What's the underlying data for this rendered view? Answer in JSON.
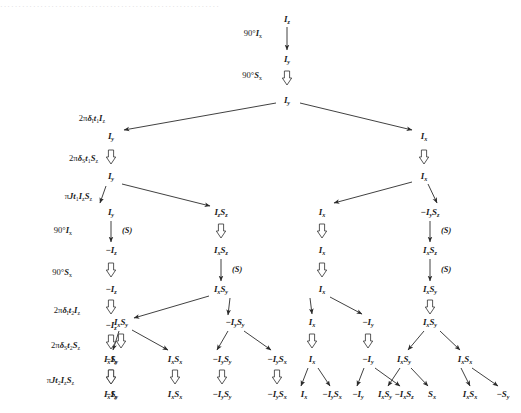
{
  "figure": {
    "title_fragment": "product operator evolution tree",
    "cropped_header_text": "····························································",
    "colors": {
      "text": "#1a1a1a",
      "arrow": "#2b2b2b",
      "double_arrow": "#3a3a3a",
      "background": "#ffffff"
    }
  },
  "operator_labels": [
    {
      "id": "op-90-ix-1",
      "html": "90°<i>I</i><sub>x</sub>",
      "x": 262,
      "y": 33
    },
    {
      "id": "op-90-sx-1",
      "html": "90°<i>S</i><sub>x</sub>",
      "x": 262,
      "y": 75
    },
    {
      "id": "op-2pi-di-t1",
      "html": "2π<i>δ</i><sub>I</sub><i>t</i><sub>1</sub><i>I</i><sub>z</sub>",
      "x": 105,
      "y": 118
    },
    {
      "id": "op-2pi-ds-t1",
      "html": "2π<i>δ</i><sub>S</sub><i>t</i><sub>1</sub><i>S</i><sub>z</sub>",
      "x": 98,
      "y": 158
    },
    {
      "id": "op-pi-j-t1",
      "html": "π<i>Jt</i><sub>1</sub><i>I</i><sub>z</sub><i>S</i><sub>z</sub>",
      "x": 92,
      "y": 196
    },
    {
      "id": "op-90-ix-2",
      "html": "90°<i>I</i><sub>x</sub>",
      "x": 72,
      "y": 230
    },
    {
      "id": "op-90-sx-2",
      "html": "90°<i>S</i><sub>x</sub>",
      "x": 72,
      "y": 272
    },
    {
      "id": "op-2pi-di-t2",
      "html": "2π<i>δ</i><sub>I</sub><i>t</i><sub>2</sub><i>I</i><sub>z</sub>",
      "x": 80,
      "y": 310
    },
    {
      "id": "op-2pi-ds-t2",
      "html": "2π<i>δ</i><sub>S</sub><i>t</i><sub>2</sub><i>S</i><sub>z</sub>",
      "x": 80,
      "y": 345
    },
    {
      "id": "op-pi-j-t2",
      "html": "π<i>Jt</i><sub>2</sub><i>I</i><sub>z</sub><i>S</i><sub>z</sub>",
      "x": 74,
      "y": 380
    }
  ],
  "nodes": [
    {
      "id": "n-root",
      "html": "<i>I</i><sub>z</sub>",
      "x": 287,
      "y": 19,
      "size": 9
    },
    {
      "id": "n-iy-1",
      "html": "<i>I</i><sub>y</sub>",
      "x": 287,
      "y": 59,
      "size": 9
    },
    {
      "id": "n-iy-2",
      "html": "<i>I</i><sub>y</sub>",
      "x": 287,
      "y": 100,
      "size": 9
    },
    {
      "id": "n-l-iy-a",
      "html": "<i>I</i><sub>y</sub>",
      "x": 111,
      "y": 136,
      "size": 9
    },
    {
      "id": "n-l-iy-b",
      "html": "<i>I</i><sub>y</sub>",
      "x": 111,
      "y": 176,
      "size": 9
    },
    {
      "id": "n-l-iy-c",
      "html": "<i>I</i><sub>y</sub>",
      "x": 111,
      "y": 212,
      "size": 9
    },
    {
      "id": "n-l-mi-1",
      "html": "−<i>I</i><sub>z</sub>",
      "x": 111,
      "y": 250,
      "size": 9
    },
    {
      "id": "n-l-mi-2",
      "html": "−<i>I</i><sub>z</sub>",
      "x": 111,
      "y": 289,
      "size": 9
    },
    {
      "id": "n-l-mi-3",
      "html": "−<i>I</i><sub>z</sub>",
      "x": 111,
      "y": 325,
      "size": 9
    },
    {
      "id": "n-l-mi-4",
      "html": "−<i>I</i><sub>z</sub>",
      "x": 111,
      "y": 359,
      "size": 9
    },
    {
      "id": "n-l-mi-5",
      "html": "−<i>I</i><sub>z</sub>",
      "x": 111,
      "y": 394,
      "size": 9
    },
    {
      "id": "n-izsz-1",
      "html": "<i>I</i><sub>z</sub><i>S</i><sub>z</sub>",
      "x": 221,
      "y": 212,
      "size": 9
    },
    {
      "id": "n-ixsz-1",
      "html": "<i>I</i><sub>x</sub><i>S</i><sub>z</sub>",
      "x": 221,
      "y": 250,
      "size": 9
    },
    {
      "id": "n-ixsy-1",
      "html": "<i>I</i><sub>x</sub><i>S</i><sub>y</sub>",
      "x": 221,
      "y": 289,
      "size": 9
    },
    {
      "id": "n-ixsy-2",
      "html": "<i>I</i><sub>x</sub><i>S</i><sub>y</sub>",
      "x": 121,
      "y": 322,
      "size": 9
    },
    {
      "id": "n-ixsy-3",
      "html": "<i>I</i><sub>x</sub><i>S</i><sub>y</sub>",
      "x": 111,
      "y": 359,
      "size": 9
    },
    {
      "id": "n-ixsy-4",
      "html": "<i>I</i><sub>x</sub><i>S</i><sub>y</sub>",
      "x": 111,
      "y": 394,
      "size": 9
    },
    {
      "id": "n-ixsx-1",
      "html": "<i>I</i><sub>x</sub><i>S</i><sub>x</sub>",
      "x": 175,
      "y": 359,
      "size": 9
    },
    {
      "id": "n-ixsx-2",
      "html": "<i>I</i><sub>x</sub><i>S</i><sub>x</sub>",
      "x": 175,
      "y": 394,
      "size": 9
    },
    {
      "id": "n-miysy-1",
      "html": "−<i>I</i><sub>y</sub><i>S</i><sub>y</sub>",
      "x": 235,
      "y": 322,
      "size": 9
    },
    {
      "id": "n-miysy-2",
      "html": "−<i>I</i><sub>y</sub><i>S</i><sub>y</sub>",
      "x": 222,
      "y": 359,
      "size": 9
    },
    {
      "id": "n-miysy-3",
      "html": "−<i>I</i><sub>y</sub><i>S</i><sub>y</sub>",
      "x": 222,
      "y": 394,
      "size": 9
    },
    {
      "id": "n-miysx-1",
      "html": "−<i>I</i><sub>y</sub><i>S</i><sub>x</sub>",
      "x": 277,
      "y": 359,
      "size": 9
    },
    {
      "id": "n-miysx-2",
      "html": "−<i>I</i><sub>y</sub><i>S</i><sub>x</sub>",
      "x": 277,
      "y": 394,
      "size": 9
    },
    {
      "id": "n-m-ix-1",
      "html": "<i>I</i><sub>x</sub>",
      "x": 322,
      "y": 212,
      "size": 9
    },
    {
      "id": "n-m-ix-2",
      "html": "<i>I</i><sub>x</sub>",
      "x": 322,
      "y": 250,
      "size": 9
    },
    {
      "id": "n-m-ix-3",
      "html": "<i>I</i><sub>x</sub>",
      "x": 322,
      "y": 289,
      "size": 9
    },
    {
      "id": "n-m-ix-4",
      "html": "<i>I</i><sub>x</sub>",
      "x": 312,
      "y": 322,
      "size": 9
    },
    {
      "id": "n-m-ix-5",
      "html": "<i>I</i><sub>x</sub>",
      "x": 312,
      "y": 359,
      "size": 9
    },
    {
      "id": "n-m-ix-6",
      "html": "<i>I</i><sub>x</sub>",
      "x": 304,
      "y": 394,
      "size": 9
    },
    {
      "id": "n-miy-1",
      "html": "−<i>I</i><sub>y</sub>",
      "x": 368,
      "y": 322,
      "size": 9
    },
    {
      "id": "n-miy-2",
      "html": "−<i>I</i><sub>y</sub>",
      "x": 368,
      "y": 359,
      "size": 9
    },
    {
      "id": "n-miy-3",
      "html": "−<i>I</i><sub>y</sub>",
      "x": 358,
      "y": 394,
      "size": 9
    },
    {
      "id": "n-miysx-3",
      "html": "−<i>I</i><sub>y</sub><i>S</i><sub>x</sub>",
      "x": 332,
      "y": 394,
      "size": 9
    },
    {
      "id": "n-mixsx-1",
      "html": "−<i>I</i><sub>x</sub><i>S</i><sub>z</sub>",
      "x": 404,
      "y": 394,
      "size": 9
    },
    {
      "id": "n-r-ix-1",
      "html": "<i>I</i><sub>x</sub>",
      "x": 424,
      "y": 136,
      "size": 9
    },
    {
      "id": "n-r-ix-2",
      "html": "<i>I</i><sub>x</sub>",
      "x": 424,
      "y": 176,
      "size": 9
    },
    {
      "id": "n-r-miysz",
      "html": "−<i>I</i><sub>y</sub><i>S</i><sub>z</sub>",
      "x": 430,
      "y": 212,
      "size": 9
    },
    {
      "id": "n-r-ixsz",
      "html": "<i>I</i><sub>x</sub><i>S</i><sub>z</sub>",
      "x": 430,
      "y": 250,
      "size": 9
    },
    {
      "id": "n-r-ixsy1",
      "html": "<i>I</i><sub>x</sub><i>S</i><sub>y</sub>",
      "x": 430,
      "y": 289,
      "size": 9
    },
    {
      "id": "n-r-ixsy2",
      "html": "<i>I</i><sub>x</sub><i>S</i><sub>y</sub>",
      "x": 430,
      "y": 322,
      "size": 9
    },
    {
      "id": "n-r-ixsy3",
      "html": "<i>I</i><sub>x</sub><i>S</i><sub>y</sub>",
      "x": 404,
      "y": 359,
      "size": 9
    },
    {
      "id": "n-r-ixsx1",
      "html": "<i>I</i><sub>x</sub><i>S</i><sub>x</sub>",
      "x": 465,
      "y": 359,
      "size": 9
    },
    {
      "id": "n-r-ixsy4",
      "html": "<i>I</i><sub>x</sub><i>S</i><sub>y</sub>",
      "x": 385,
      "y": 394,
      "size": 9
    },
    {
      "id": "n-r-sx",
      "html": "<i>S</i><sub>x</sub>",
      "x": 432,
      "y": 394,
      "size": 9
    },
    {
      "id": "n-r-ixsx2",
      "html": "<i>I</i><sub>x</sub><i>S</i><sub>x</sub>",
      "x": 470,
      "y": 394,
      "size": 9
    },
    {
      "id": "n-r-msy",
      "html": "−<i>S</i><sub>y</sub>",
      "x": 503,
      "y": 394,
      "size": 9
    }
  ],
  "annotations": [
    {
      "id": "ann-s-1",
      "html": "(<i>S</i>)",
      "x": 122,
      "y": 231
    },
    {
      "id": "ann-s-2",
      "html": "(<i>S</i>)",
      "x": 232,
      "y": 270
    },
    {
      "id": "ann-s-3",
      "html": "(<i>S</i>)",
      "x": 441,
      "y": 231
    },
    {
      "id": "ann-s-4",
      "html": "(<i>S</i>)",
      "x": 441,
      "y": 270
    }
  ],
  "single_arrows": [
    {
      "id": "ar-root",
      "x1": 287,
      "y1": 27,
      "x2": 287,
      "y2": 50
    },
    {
      "id": "ar-l-90ix",
      "x1": 111,
      "y1": 221,
      "x2": 111,
      "y2": 242
    },
    {
      "id": "ar-m-ixsz-sy",
      "x1": 221,
      "y1": 259,
      "x2": 221,
      "y2": 281
    },
    {
      "id": "ar-r-miysz-sz",
      "x1": 430,
      "y1": 221,
      "x2": 430,
      "y2": 242
    },
    {
      "id": "ar-r-ixsz-sy",
      "x1": 430,
      "y1": 259,
      "x2": 430,
      "y2": 281
    }
  ],
  "branch_arrows": [
    {
      "id": "br-root-left",
      "x1": 276,
      "y1": 103,
      "x2": 124,
      "y2": 130
    },
    {
      "id": "br-root-right",
      "x1": 300,
      "y1": 103,
      "x2": 412,
      "y2": 130
    },
    {
      "id": "br-iy-left",
      "x1": 106,
      "y1": 186,
      "x2": 100,
      "y2": 203
    },
    {
      "id": "br-iy-right",
      "x1": 122,
      "y1": 184,
      "x2": 210,
      "y2": 206
    },
    {
      "id": "br-rix-left",
      "x1": 412,
      "y1": 182,
      "x2": 334,
      "y2": 203
    },
    {
      "id": "br-rix-right",
      "x1": 428,
      "y1": 184,
      "x2": 437,
      "y2": 203
    },
    {
      "id": "br-ixsy-left",
      "x1": 209,
      "y1": 296,
      "x2": 134,
      "y2": 318
    },
    {
      "id": "br-ixsy-right",
      "x1": 230,
      "y1": 298,
      "x2": 228,
      "y2": 315
    },
    {
      "id": "br-ixsy2-down",
      "x1": 119,
      "y1": 331,
      "x2": 113,
      "y2": 350
    },
    {
      "id": "br-ixsy2-right",
      "x1": 132,
      "y1": 330,
      "x2": 168,
      "y2": 350
    },
    {
      "id": "br-miysy-left",
      "x1": 228,
      "y1": 331,
      "x2": 217,
      "y2": 350
    },
    {
      "id": "br-miysy-right",
      "x1": 244,
      "y1": 331,
      "x2": 271,
      "y2": 350
    },
    {
      "id": "br-mix-left",
      "x1": 310,
      "y1": 298,
      "x2": 312,
      "y2": 314
    },
    {
      "id": "br-mix-right",
      "x1": 330,
      "y1": 297,
      "x2": 362,
      "y2": 314
    },
    {
      "id": "br-mix5-left",
      "x1": 308,
      "y1": 368,
      "x2": 301,
      "y2": 386
    },
    {
      "id": "br-mix5-right",
      "x1": 318,
      "y1": 368,
      "x2": 330,
      "y2": 386
    },
    {
      "id": "br-miy2-left",
      "x1": 364,
      "y1": 368,
      "x2": 357,
      "y2": 386
    },
    {
      "id": "br-miy2-right",
      "x1": 375,
      "y1": 368,
      "x2": 400,
      "y2": 386
    },
    {
      "id": "br-rixsy2-left",
      "x1": 424,
      "y1": 331,
      "x2": 408,
      "y2": 350
    },
    {
      "id": "br-rixsy2-right",
      "x1": 440,
      "y1": 331,
      "x2": 460,
      "y2": 350
    },
    {
      "id": "br-rixsy3-left",
      "x1": 400,
      "y1": 368,
      "x2": 388,
      "y2": 386
    },
    {
      "id": "br-rixsy3-right",
      "x1": 411,
      "y1": 368,
      "x2": 428,
      "y2": 386
    },
    {
      "id": "br-rixsx1-left",
      "x1": 461,
      "y1": 368,
      "x2": 470,
      "y2": 386
    },
    {
      "id": "br-rixsx1-right",
      "x1": 472,
      "y1": 368,
      "x2": 498,
      "y2": 386
    }
  ],
  "double_arrows": [
    {
      "id": "da-90sx-1",
      "x": 287,
      "y": 78
    },
    {
      "id": "da-l-2",
      "x": 111,
      "y": 157
    },
    {
      "id": "da-l-90sx",
      "x": 111,
      "y": 270
    },
    {
      "id": "da-l-dt2",
      "x": 111,
      "y": 307
    },
    {
      "id": "da-l-dst2",
      "x": 111,
      "y": 342
    },
    {
      "id": "da-l-jt2",
      "x": 111,
      "y": 377
    },
    {
      "id": "da-m-izsz",
      "x": 221,
      "y": 231
    },
    {
      "id": "da-ixsy3",
      "x": 111,
      "y": 377
    },
    {
      "id": "da-ixsy-a",
      "x": 121,
      "y": 341
    },
    {
      "id": "da-ixsx-a",
      "x": 175,
      "y": 377
    },
    {
      "id": "da-miysy-a",
      "x": 222,
      "y": 377
    },
    {
      "id": "da-miysx-a",
      "x": 277,
      "y": 377
    },
    {
      "id": "da-m-ix2",
      "x": 322,
      "y": 231
    },
    {
      "id": "da-m-ix3",
      "x": 322,
      "y": 270
    },
    {
      "id": "da-m-ix4",
      "x": 312,
      "y": 341
    },
    {
      "id": "da-miy-a",
      "x": 368,
      "y": 341
    },
    {
      "id": "da-r-ix",
      "x": 424,
      "y": 157
    },
    {
      "id": "da-r-ixsy",
      "x": 430,
      "y": 307
    }
  ]
}
